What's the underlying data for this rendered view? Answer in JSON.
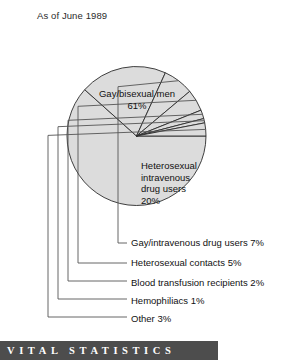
{
  "header": {
    "title": "As of June 1989"
  },
  "banner": {
    "text": "VITAL STATISTICS"
  },
  "colors": {
    "slice_fill": "#dcdcdc",
    "slice_stroke": "#2b2b2b",
    "leader_line": "#555555",
    "banner_background": "#4d4d4d",
    "banner_text": "#ffffff",
    "text": "#111111",
    "page_background": "#ffffff"
  },
  "inside_labels": {
    "primary": {
      "name": "Gay/bisexual men",
      "percent": "61%"
    },
    "secondary": {
      "line1": "Heterosexual",
      "line2": "intravenous",
      "line3": "drug users",
      "line4": "20%"
    }
  },
  "leader_labels": [
    {
      "text": "Gay/intravenous drug users 7%"
    },
    {
      "text": "Heterosexual contacts 5%"
    },
    {
      "text": "Blood transfusion recipients 2%"
    },
    {
      "text": "Hemophiliacs 1%"
    },
    {
      "text": "Other 3%"
    }
  ],
  "chart_data": {
    "type": "pie",
    "title": "As of June 1989",
    "subtitle": "",
    "xlabel": "",
    "ylabel": "",
    "legend_position": "leader-lines-below",
    "grid": false,
    "units": "percent",
    "total": 99,
    "start_angle_deg": 0,
    "direction": "clockwise",
    "categories": [
      "Gay/bisexual men",
      "Heterosexual intravenous drug users",
      "Gay/intravenous drug users",
      "Heterosexual contacts",
      "Blood transfusion recipients",
      "Hemophiliacs",
      "Other"
    ],
    "values": [
      61,
      20,
      7,
      5,
      2,
      1,
      3
    ],
    "labels": [
      "61%",
      "20%",
      "7%",
      "5%",
      "2%",
      "1%",
      "3%"
    ],
    "slices": [
      {
        "name": "Gay/bisexual men",
        "value": 61,
        "label": "61%",
        "label_placement": "inside"
      },
      {
        "name": "Heterosexual intravenous drug users",
        "value": 20,
        "label": "20%",
        "label_placement": "inside"
      },
      {
        "name": "Gay/intravenous drug users",
        "value": 7,
        "label": "7%",
        "label_placement": "leader"
      },
      {
        "name": "Heterosexual contacts",
        "value": 5,
        "label": "5%",
        "label_placement": "leader"
      },
      {
        "name": "Blood transfusion recipients",
        "value": 2,
        "label": "2%",
        "label_placement": "leader"
      },
      {
        "name": "Hemophiliacs",
        "value": 1,
        "label": "1%",
        "label_placement": "leader"
      },
      {
        "name": "Other",
        "value": 3,
        "label": "3%",
        "label_placement": "leader"
      }
    ]
  }
}
